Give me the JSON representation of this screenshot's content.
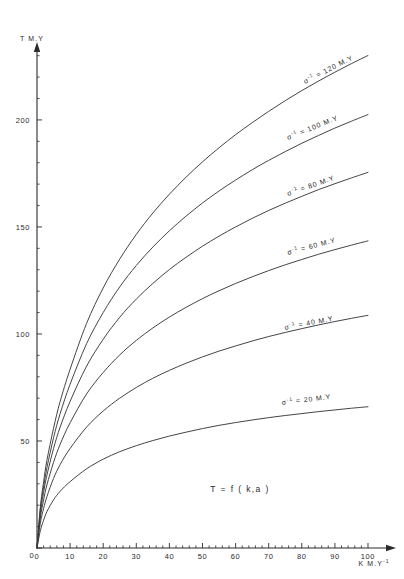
{
  "chart_data": {
    "type": "line",
    "title": "",
    "annotation": "T = f ( k,a )",
    "xlabel": "K  M.Y",
    "xlabel_sup": "-1",
    "ylabel": "T  M.Y",
    "xlim": [
      0,
      100
    ],
    "ylim": [
      0,
      235
    ],
    "grid": false,
    "legend_position": "inline-curve-labels",
    "xticks": [
      0,
      10,
      20,
      30,
      40,
      50,
      60,
      70,
      80,
      90,
      100
    ],
    "xticklabels": [
      "0",
      "10",
      "20",
      "30",
      "40",
      "50",
      "60",
      "70",
      "80",
      "90",
      "100"
    ],
    "x_minor_step": 2,
    "yticks": [
      0,
      50,
      100,
      150,
      200
    ],
    "yticklabels": [
      "0",
      "50",
      "100",
      "150",
      "200"
    ],
    "y_minor_step": 10,
    "x": [
      0,
      1,
      2,
      3,
      5,
      7,
      10,
      15,
      20,
      25,
      30,
      35,
      40,
      45,
      50,
      55,
      60,
      65,
      70,
      75,
      80,
      85,
      90,
      95,
      100
    ],
    "series": [
      {
        "name": "sigma-inv-20",
        "label_prefix": "σ",
        "label_sup": "-1",
        "label_suffix": "= 20 M.Y",
        "label_text": "σ⁻¹ = 20 M.Y",
        "sigma_inverse": 20,
        "units": "M.Y",
        "color": "#3a3a3a",
        "values": [
          0,
          8.0,
          13.0,
          17.0,
          22.5,
          26.5,
          31.0,
          37.0,
          41.5,
          45.0,
          47.8,
          50.2,
          52.3,
          54.1,
          55.8,
          57.3,
          58.6,
          59.8,
          60.9,
          61.9,
          62.8,
          63.7,
          64.5,
          65.3,
          66.0
        ]
      },
      {
        "name": "sigma-inv-40",
        "label_prefix": "σ",
        "label_sup": "-1",
        "label_suffix": "= 40 M.Y",
        "label_text": "σ⁻¹ = 40 M.Y",
        "sigma_inverse": 40,
        "units": "M.Y",
        "color": "#3a3a3a",
        "values": [
          0,
          11.5,
          18.5,
          24.0,
          32.5,
          39.0,
          46.5,
          56.5,
          64.0,
          70.0,
          75.0,
          79.3,
          83.0,
          86.3,
          89.3,
          92.0,
          94.4,
          96.7,
          98.8,
          100.7,
          102.5,
          104.2,
          105.8,
          107.3,
          108.7
        ]
      },
      {
        "name": "sigma-inv-60",
        "label_prefix": "σ",
        "label_sup": "-1",
        "label_suffix": "= 60 M.Y",
        "label_text": "σ⁻¹ = 60 M.Y",
        "sigma_inverse": 60,
        "units": "M.Y",
        "color": "#3a3a3a",
        "values": [
          0,
          14.0,
          22.5,
          29.5,
          40.0,
          48.5,
          58.5,
          72.0,
          82.0,
          90.2,
          97.0,
          102.8,
          107.9,
          112.4,
          116.5,
          120.2,
          123.6,
          126.7,
          129.6,
          132.3,
          134.8,
          137.2,
          139.4,
          141.5,
          143.5
        ]
      },
      {
        "name": "sigma-inv-80",
        "label_prefix": "σ",
        "label_sup": "-1",
        "label_suffix": "= 80 M.Y",
        "label_text": "σ⁻¹ = 80 M.Y",
        "sigma_inverse": 80,
        "units": "M.Y",
        "color": "#3a3a3a",
        "values": [
          0,
          16.0,
          26.0,
          34.0,
          46.5,
          56.5,
          68.5,
          85.0,
          97.5,
          107.8,
          116.3,
          123.6,
          130.1,
          135.8,
          141.0,
          145.7,
          150.0,
          154.0,
          157.7,
          161.1,
          164.3,
          167.4,
          170.2,
          172.9,
          175.5
        ]
      },
      {
        "name": "sigma-inv-100",
        "label_prefix": "σ",
        "label_sup": "-1",
        "label_suffix": "= 100 M.Y",
        "label_text": "σ⁻¹ = 100 M.Y",
        "sigma_inverse": 100,
        "units": "M.Y",
        "color": "#3a3a3a",
        "values": [
          0,
          17.5,
          28.5,
          37.5,
          51.5,
          62.8,
          76.5,
          95.5,
          110.0,
          122.0,
          132.0,
          140.6,
          148.2,
          155.0,
          161.2,
          166.8,
          171.9,
          176.7,
          181.1,
          185.2,
          189.1,
          192.7,
          196.2,
          199.4,
          202.5
        ]
      },
      {
        "name": "sigma-inv-120",
        "label_prefix": "σ",
        "label_sup": "-1",
        "label_suffix": "= 120 M.Y",
        "label_text": "σ⁻¹ = 120 M.Y",
        "sigma_inverse": 120,
        "units": "M.Y",
        "color": "#3a3a3a",
        "values": [
          0,
          19.0,
          31.0,
          41.0,
          56.0,
          68.5,
          83.5,
          105.0,
          121.5,
          135.0,
          146.5,
          156.5,
          165.3,
          173.2,
          180.4,
          187.0,
          193.1,
          198.7,
          204.0,
          209.0,
          213.7,
          218.1,
          222.3,
          226.3,
          230.1
        ]
      }
    ],
    "curve_labels": [
      {
        "text": "σ⁻¹ = 120 M.Y",
        "x_px": 305,
        "y_px": 84,
        "rotation": -27
      },
      {
        "text": "σ⁻¹ = 100 M.Y",
        "x_px": 288,
        "y_px": 140,
        "rotation": -22
      },
      {
        "text": "σ⁻¹ = 80 M.Y",
        "x_px": 288,
        "y_px": 196,
        "rotation": -19
      },
      {
        "text": "σ⁻¹ = 60 M.Y",
        "x_px": 288,
        "y_px": 255,
        "rotation": -15
      },
      {
        "text": "σ⁻¹ = 40 M.Y",
        "x_px": 285,
        "y_px": 330,
        "rotation": -11
      },
      {
        "text": "σ⁻¹ = 20 M.Y",
        "x_px": 282,
        "y_px": 405,
        "rotation": -7
      }
    ]
  }
}
